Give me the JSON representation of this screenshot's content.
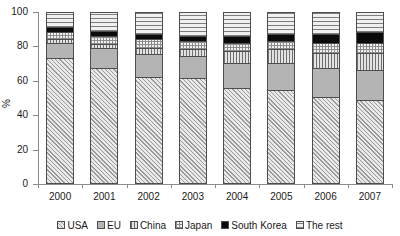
{
  "chart_data": {
    "type": "bar",
    "subtype": "stacked-100-percent",
    "title": "",
    "xlabel": "",
    "ylabel": "%",
    "ylim": [
      0,
      100
    ],
    "yticks": [
      0,
      20,
      40,
      60,
      80,
      100
    ],
    "ytick_labels": [
      "0",
      "20",
      "40",
      "60",
      "80",
      "100"
    ],
    "grid": false,
    "legend_position": "bottom",
    "categories": [
      "2000",
      "2001",
      "2002",
      "2003",
      "2004",
      "2005",
      "2006",
      "2007"
    ],
    "series": [
      {
        "name": "USA",
        "pattern": "diagonal-hatch",
        "values": [
          73,
          67,
          62,
          61,
          55,
          54,
          50,
          48
        ]
      },
      {
        "name": "EU",
        "pattern": "solid-gray",
        "values": [
          9,
          12,
          13,
          13,
          15,
          16,
          17,
          18
        ]
      },
      {
        "name": "China",
        "pattern": "vertical-lines",
        "values": [
          2,
          2,
          4,
          4,
          7,
          8,
          9,
          10
        ]
      },
      {
        "name": "Japan",
        "pattern": "cross-hatch",
        "values": [
          4,
          5,
          5,
          5,
          5,
          5,
          6,
          6
        ]
      },
      {
        "name": "South Korea",
        "pattern": "solid-black",
        "values": [
          3,
          3,
          3,
          3,
          4,
          4,
          5,
          6
        ]
      },
      {
        "name": "The rest",
        "pattern": "horizontal-lines",
        "values": [
          9,
          11,
          13,
          14,
          14,
          13,
          13,
          12
        ]
      }
    ]
  },
  "axis": {
    "y_title": "%"
  },
  "legend": {
    "items": [
      {
        "label": "USA"
      },
      {
        "label": "EU"
      },
      {
        "label": "China"
      },
      {
        "label": "Japan"
      },
      {
        "label": "South Korea"
      },
      {
        "label": "The rest"
      }
    ]
  }
}
